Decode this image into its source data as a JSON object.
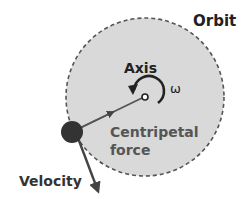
{
  "diagram": {
    "labels": {
      "orbit": "Orbit",
      "axis": "Axis",
      "omega": "ω",
      "centripetal_line1": "Centripetal",
      "centripetal_line2": "force",
      "velocity": "Velocity"
    },
    "colors": {
      "orbit_fill": "#d9d9d9",
      "orbit_stroke": "#555555",
      "ball": "#333333",
      "arrow": "#444444",
      "text_dark": "#222222",
      "text_centripetal": "#555555"
    }
  }
}
